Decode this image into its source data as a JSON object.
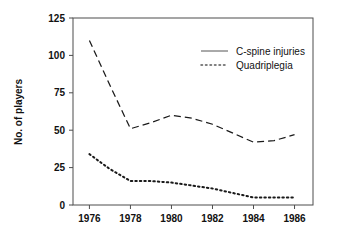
{
  "chart_data": {
    "type": "line",
    "title": "",
    "xlabel": "",
    "ylabel": "No. of players",
    "xlim": [
      1975.2,
      1986.9
    ],
    "ylim": [
      0,
      125
    ],
    "grid": false,
    "legend_position": "upper-right-inside",
    "xticks": [
      "1976",
      "1978",
      "1980",
      "1982",
      "1984",
      "1986"
    ],
    "xtick_values": [
      1976,
      1978,
      1980,
      1982,
      1984,
      1986
    ],
    "yticks": [
      "0",
      "25",
      "50",
      "75",
      "100",
      "125"
    ],
    "ytick_values": [
      0,
      25,
      50,
      75,
      100,
      125
    ],
    "x": [
      1976,
      1977,
      1978,
      1979,
      1980,
      1981,
      1982,
      1983,
      1984,
      1985,
      1986
    ],
    "series": [
      {
        "name": "C-spine injuries",
        "style": "dashed",
        "color": "#1a1a1a",
        "values": [
          110,
          80,
          51,
          55,
          60,
          58,
          54,
          48,
          42,
          43,
          47
        ]
      },
      {
        "name": "Quadriplegia",
        "style": "dotted",
        "color": "#1a1a1a",
        "values": [
          34,
          24,
          16,
          16,
          15,
          13,
          11,
          8,
          5,
          5,
          5
        ]
      }
    ]
  },
  "legend": {
    "entries": [
      {
        "label": "C-spine injuries"
      },
      {
        "label": "Quadriplegia"
      }
    ]
  },
  "axes": {
    "y_title": "No. of players"
  },
  "colors": {
    "frame": "#4d4d4d",
    "ink": "#1a1a1a",
    "background": "#ffffff"
  }
}
